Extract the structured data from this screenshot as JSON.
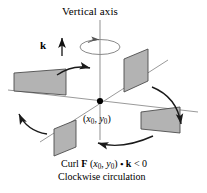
{
  "figure": {
    "title": "Vertical axis",
    "vector_label": "k",
    "point_label_open": "(",
    "point_label_x": "x",
    "point_label_x_sub": "0",
    "point_label_comma": ", ",
    "point_label_y": "y",
    "point_label_y_sub": "0",
    "point_label_close": ")",
    "caption_curl": "Curl",
    "caption_F": "F",
    "caption_point": "(x",
    "caption_point_sub1": "0",
    "caption_point_mid": ", y",
    "caption_point_sub2": "0",
    "caption_point_end": ")",
    "caption_dot": "•",
    "caption_k": "k",
    "caption_rel": "< 0",
    "caption_line1_plain": "Curl F (x0, y0) • k < 0",
    "caption_line2": "Clockwise circulation",
    "colors": {
      "panel_fill": "#b3b3b3",
      "panel_stroke": "#4d4d4d",
      "axis_stroke": "#808080",
      "arrow_stroke": "#1a1a1a",
      "text": "#000000",
      "background": "#ffffff"
    },
    "geometry": {
      "origin_x": 100,
      "origin_y": 101,
      "axis_top_y": 20,
      "axis_bottom_y": 140,
      "panel_count": 4,
      "rotation_sense": "clockwise"
    },
    "icons": {
      "up_arrow": "k-vector-arrow",
      "spin_ellipse": "axis-rotation-ellipse"
    }
  }
}
